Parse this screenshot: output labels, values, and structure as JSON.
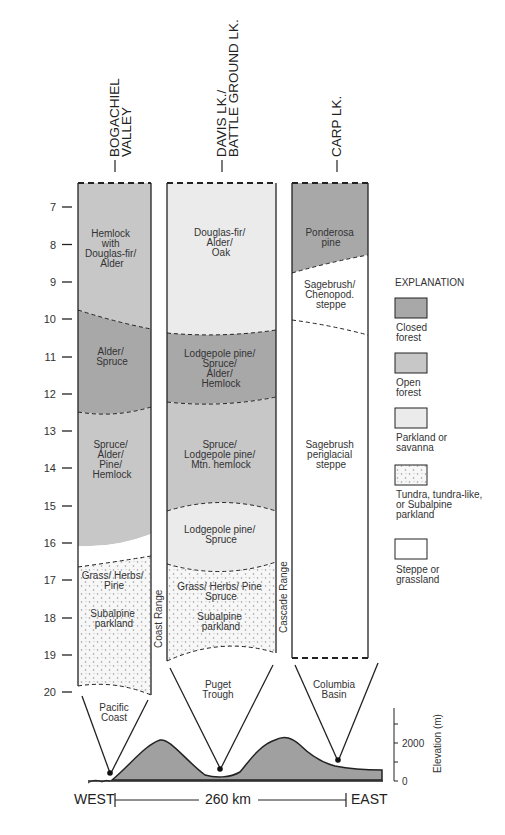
{
  "colors": {
    "closed_forest": "#a8a8a8",
    "open_forest": "#c7c7c7",
    "parkland": "#ebebeb",
    "tundra_bg": "#f7f7f7",
    "tundra_dot": "#9a9a9a",
    "steppe": "#ffffff",
    "line": "#222222",
    "terrain": "#a0a0a0"
  },
  "sites": [
    {
      "name_line1": "BOGACHIEL",
      "name_line2": "VALLEY"
    },
    {
      "name_line1": "DAVIS LK./",
      "name_line2": "BATTLE GROUND LK."
    },
    {
      "name_line1": "CARP LK.",
      "name_line2": ""
    }
  ],
  "axis": {
    "label": "Age (ka)",
    "ticks": [
      "7",
      "8",
      "9",
      "10",
      "11",
      "12",
      "13",
      "14",
      "15",
      "16",
      "17",
      "18",
      "19",
      "20"
    ]
  },
  "columns": {
    "bogachiel": {
      "zones": [
        {
          "lines": [
            "Hemlock",
            "with",
            "Douglas-fir/",
            "Alder"
          ],
          "type": "open_forest"
        },
        {
          "lines": [
            "Alder/",
            "Spruce"
          ],
          "type": "closed_forest"
        },
        {
          "lines": [
            "Spruce/",
            "Alder/",
            "Pine/",
            "Hemlock"
          ],
          "type": "open_forest"
        },
        {
          "lines": [
            "Grass/ Herbs/",
            "Pine"
          ],
          "type": "tundra"
        },
        {
          "lines": [
            "Subalpine",
            "parkland"
          ],
          "type": "tundra"
        }
      ],
      "region": [
        "Pacific",
        "Coast"
      ]
    },
    "davis": {
      "zones": [
        {
          "lines": [
            "Douglas-fir/",
            "Alder/",
            "Oak"
          ],
          "type": "parkland"
        },
        {
          "lines": [
            "Lodgepole pine/",
            "Spruce/",
            "Alder/",
            "Hemlock"
          ],
          "type": "closed_forest"
        },
        {
          "lines": [
            "Spruce/",
            "Lodgepole pine/",
            "Mtn. hemlock"
          ],
          "type": "open_forest"
        },
        {
          "lines": [
            "Lodgepole pine/",
            "Spruce"
          ],
          "type": "parkland"
        },
        {
          "lines": [
            "Grass/ Herbs/ Pine",
            "Spruce"
          ],
          "type": "tundra"
        },
        {
          "lines": [
            "Subalpine",
            "parkland"
          ],
          "type": "tundra"
        }
      ],
      "region": [
        "Puget",
        "Trough"
      ]
    },
    "carp": {
      "zones": [
        {
          "lines": [
            "Ponderosa",
            "pine"
          ],
          "type": "closed_forest"
        },
        {
          "lines": [
            "Sagebrush/",
            "Chenopod.",
            "steppe"
          ],
          "type": "steppe"
        },
        {
          "lines": [
            "Sagebrush",
            "periglacial",
            "steppe"
          ],
          "type": "steppe"
        }
      ],
      "region": [
        "Columbia",
        "Basin"
      ]
    }
  },
  "ranges": {
    "coast": "Coast Range",
    "cascade": "Cascade Range"
  },
  "explanation": {
    "title": "EXPLANATION",
    "items": [
      {
        "lines": [
          "Closed",
          "forest"
        ],
        "type": "closed_forest"
      },
      {
        "lines": [
          "Open",
          "forest"
        ],
        "type": "open_forest"
      },
      {
        "lines": [
          "Parkland or",
          "savanna"
        ],
        "type": "parkland"
      },
      {
        "lines": [
          "Tundra, tundra-like,",
          "or Subalpine",
          "parkland"
        ],
        "type": "tundra"
      },
      {
        "lines": [
          "Steppe or",
          "grassland"
        ],
        "type": "steppe"
      }
    ]
  },
  "profile": {
    "west": "WEST",
    "east": "EAST",
    "distance": "260 km",
    "elevation_label": "Elevation (m)",
    "elevation_ticks": [
      "2000",
      "0"
    ]
  }
}
